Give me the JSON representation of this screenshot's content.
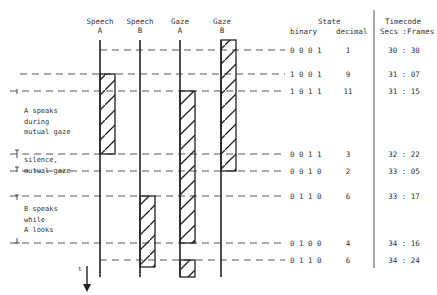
{
  "columns": [
    {
      "label": "Speech",
      "sub": "A",
      "x": 100
    },
    {
      "label": "Speech",
      "sub": "B",
      "x": 140
    },
    {
      "label": "Gaze",
      "sub": "A",
      "x": 180
    },
    {
      "label": "Gaze",
      "sub": "B",
      "x": 221
    }
  ],
  "state_header": {
    "title": "State",
    "binary": "binary",
    "decimal": "decimal"
  },
  "timecode_header": {
    "title": "Timecode",
    "sub": "Secs :Frames"
  },
  "rows": [
    {
      "y": 50,
      "binary": "0 0 0 1",
      "decimal": "1",
      "timecode": "30 : 30"
    },
    {
      "y": 74,
      "binary": "1 0 0 1",
      "decimal": "9",
      "timecode": "31 : 07"
    },
    {
      "y": 91,
      "binary": "1 0 1 1",
      "decimal": "11",
      "timecode": "31 : 15"
    },
    {
      "y": 154,
      "binary": "0 0 1 1",
      "decimal": "3",
      "timecode": "32 : 22"
    },
    {
      "y": 171,
      "binary": "0 0 1 0",
      "decimal": "2",
      "timecode": "33 : 05"
    },
    {
      "y": 196,
      "binary": "0 1 1 0",
      "decimal": "6",
      "timecode": "33 : 17"
    },
    {
      "y": 243,
      "binary": "0 1 0 0",
      "decimal": "4",
      "timecode": "34 : 16"
    },
    {
      "y": 260,
      "binary": "0 1 1 0",
      "decimal": "6",
      "timecode": "34 : 24"
    }
  ],
  "bars": [
    {
      "column": "Speech A",
      "y1": 74,
      "y2": 154
    },
    {
      "column": "Gaze A",
      "y1": 91,
      "y2": 243
    },
    {
      "column": "Gaze A",
      "y1": 260,
      "y2": 277
    },
    {
      "column": "Gaze B",
      "y1": 40,
      "y2": 171
    },
    {
      "column": "Speech B",
      "y1": 196,
      "y2": 267
    }
  ],
  "annotations": {
    "a_speaks": "A speaks\nduring\nmutual gaze",
    "silence": "silence,\nmutual gaze",
    "b_speaks": "B speaks\nwhile\nA looks",
    "time_axis": "t"
  }
}
